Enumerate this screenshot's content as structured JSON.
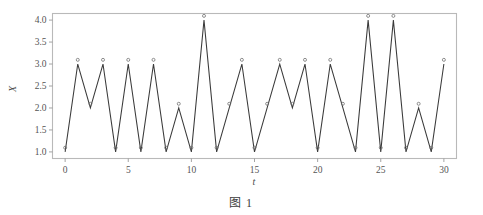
{
  "caption": "图 1",
  "colors": {
    "line": "#3a3a3a",
    "marker_stroke": "#6b6b6b",
    "frame": "#b9b9b9",
    "text": "#4a4a4a",
    "background": "#ffffff"
  },
  "chart_data": {
    "type": "line",
    "title": "",
    "subtitle": "",
    "xlabel": "t",
    "ylabel": "X",
    "x": [
      0,
      1,
      2,
      3,
      4,
      5,
      6,
      7,
      8,
      9,
      10,
      11,
      12,
      13,
      14,
      15,
      16,
      17,
      18,
      19,
      20,
      21,
      22,
      23,
      24,
      25,
      26,
      27,
      28,
      29,
      30
    ],
    "values": [
      1,
      3,
      2,
      3,
      1,
      3,
      1,
      3,
      1,
      2,
      1,
      4,
      1,
      2,
      3,
      1,
      2,
      3,
      2,
      3,
      1,
      3,
      2,
      1,
      4,
      1,
      4,
      1,
      2,
      1,
      3
    ],
    "series": [
      {
        "name": "X",
        "values": [
          1,
          3,
          2,
          3,
          1,
          3,
          1,
          3,
          1,
          2,
          1,
          4,
          1,
          2,
          3,
          1,
          2,
          3,
          2,
          3,
          1,
          3,
          2,
          1,
          4,
          1,
          4,
          1,
          2,
          1,
          3
        ]
      }
    ],
    "xlim": [
      -1,
      31
    ],
    "ylim": [
      0.85,
      4.15
    ],
    "xticks": [
      0,
      5,
      10,
      15,
      20,
      25,
      30
    ],
    "xticklabels": [
      "0",
      "5",
      "10",
      "15",
      "20",
      "25",
      "30"
    ],
    "yticks": [
      1.0,
      1.5,
      2.0,
      2.5,
      3.0,
      3.5,
      4.0
    ],
    "yticklabels": [
      "1.0",
      "1.5",
      "2.0",
      "2.5",
      "3.0",
      "3.5",
      "4.0"
    ],
    "grid": false,
    "legend": false,
    "legend_position": "none",
    "marker": "open-circle",
    "annotations": []
  }
}
